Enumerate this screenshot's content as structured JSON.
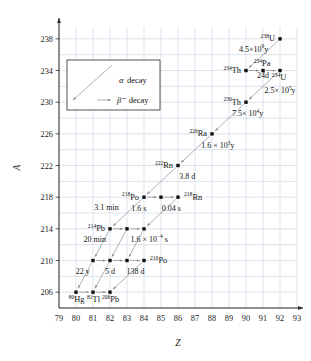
{
  "chart_data": {
    "type": "scatter",
    "title": "",
    "xlabel": "Z",
    "ylabel": "A",
    "xlim": [
      79,
      93
    ],
    "ylim": [
      204,
      239.5
    ],
    "xticks": [
      79,
      80,
      81,
      82,
      83,
      84,
      85,
      86,
      87,
      88,
      89,
      90,
      91,
      92,
      93
    ],
    "yticks": [
      206,
      210,
      214,
      218,
      222,
      226,
      230,
      234,
      238
    ],
    "grid": true,
    "legend_position": "upper-left",
    "legend": [
      {
        "symbol": "alpha",
        "label": "decay",
        "greek": "α"
      },
      {
        "symbol": "beta",
        "label": "decay",
        "greek": "β⁻"
      }
    ],
    "points": [
      {
        "Z": 92,
        "A": 238,
        "label": "U",
        "mass": "238",
        "label_pos": "left"
      },
      {
        "Z": 90,
        "A": 234,
        "label": "Th",
        "mass": "234",
        "label_pos": "left"
      },
      {
        "Z": 91,
        "A": 234,
        "label": "Pa",
        "mass": "234",
        "label_pos": "above"
      },
      {
        "Z": 92,
        "A": 234,
        "label": "U",
        "mass": "234",
        "label_pos": "below-right"
      },
      {
        "Z": 90,
        "A": 230,
        "label": "Th",
        "mass": "230",
        "label_pos": "left"
      },
      {
        "Z": 88,
        "A": 226,
        "label": "Ra",
        "mass": "226",
        "label_pos": "left"
      },
      {
        "Z": 86,
        "A": 222,
        "label": "Rn",
        "mass": "222",
        "label_pos": "left"
      },
      {
        "Z": 84,
        "A": 218,
        "label": "Po",
        "mass": "218",
        "label_pos": "left"
      },
      {
        "Z": 85,
        "A": 218,
        "label": "",
        "mass": "",
        "label_pos": "none"
      },
      {
        "Z": 86,
        "A": 218,
        "label": "Rn",
        "mass": "218",
        "label_pos": "right"
      },
      {
        "Z": 82,
        "A": 214,
        "label": "Pb",
        "mass": "214",
        "label_pos": "left"
      },
      {
        "Z": 83,
        "A": 214,
        "label": "",
        "mass": "",
        "label_pos": "none"
      },
      {
        "Z": 84,
        "A": 214,
        "label": "",
        "mass": "",
        "label_pos": "none"
      },
      {
        "Z": 81,
        "A": 210,
        "label": "",
        "mass": "",
        "label_pos": "none"
      },
      {
        "Z": 82,
        "A": 210,
        "label": "",
        "mass": "",
        "label_pos": "none"
      },
      {
        "Z": 83,
        "A": 210,
        "label": "",
        "mass": "",
        "label_pos": "none"
      },
      {
        "Z": 84,
        "A": 210,
        "label": "Po",
        "mass": "210",
        "label_pos": "right"
      },
      {
        "Z": 80,
        "A": 206,
        "label": "Hg",
        "mass": "80",
        "label_pos": "below"
      },
      {
        "Z": 81,
        "A": 206,
        "label": "Tl",
        "mass": "81",
        "label_pos": "below"
      },
      {
        "Z": 82,
        "A": 206,
        "label": "Pb",
        "mass": "206",
        "label_pos": "below"
      }
    ],
    "transitions": [
      {
        "from": [
          92,
          238
        ],
        "to": [
          90,
          234
        ],
        "type": "alpha"
      },
      {
        "from": [
          90,
          234
        ],
        "to": [
          91,
          234
        ],
        "type": "beta"
      },
      {
        "from": [
          91,
          234
        ],
        "to": [
          92,
          234
        ],
        "type": "beta"
      },
      {
        "from": [
          92,
          234
        ],
        "to": [
          90,
          230
        ],
        "type": "alpha"
      },
      {
        "from": [
          90,
          230
        ],
        "to": [
          88,
          226
        ],
        "type": "alpha"
      },
      {
        "from": [
          88,
          226
        ],
        "to": [
          86,
          222
        ],
        "type": "alpha"
      },
      {
        "from": [
          86,
          222
        ],
        "to": [
          84,
          218
        ],
        "type": "alpha"
      },
      {
        "from": [
          84,
          218
        ],
        "to": [
          85,
          218
        ],
        "type": "beta"
      },
      {
        "from": [
          85,
          218
        ],
        "to": [
          86,
          218
        ],
        "type": "beta"
      },
      {
        "from": [
          84,
          218
        ],
        "to": [
          82,
          214
        ],
        "type": "alpha"
      },
      {
        "from": [
          86,
          218
        ],
        "to": [
          84,
          214
        ],
        "type": "alpha"
      },
      {
        "from": [
          82,
          214
        ],
        "to": [
          83,
          214
        ],
        "type": "beta"
      },
      {
        "from": [
          83,
          214
        ],
        "to": [
          84,
          214
        ],
        "type": "beta"
      },
      {
        "from": [
          82,
          214
        ],
        "to": [
          81,
          210
        ],
        "type": "alpha"
      },
      {
        "from": [
          83,
          214
        ],
        "to": [
          82,
          210
        ],
        "type": "alpha"
      },
      {
        "from": [
          84,
          214
        ],
        "to": [
          83,
          210
        ],
        "type": "alpha"
      },
      {
        "from": [
          81,
          210
        ],
        "to": [
          82,
          210
        ],
        "type": "beta"
      },
      {
        "from": [
          82,
          210
        ],
        "to": [
          83,
          210
        ],
        "type": "beta"
      },
      {
        "from": [
          83,
          210
        ],
        "to": [
          84,
          210
        ],
        "type": "beta"
      },
      {
        "from": [
          81,
          210
        ],
        "to": [
          80,
          206
        ],
        "type": "alpha"
      },
      {
        "from": [
          82,
          210
        ],
        "to": [
          81,
          206
        ],
        "type": "alpha"
      },
      {
        "from": [
          84,
          210
        ],
        "to": [
          82,
          206
        ],
        "type": "alpha"
      },
      {
        "from": [
          80,
          206
        ],
        "to": [
          81,
          206
        ],
        "type": "beta"
      },
      {
        "from": [
          81,
          206
        ],
        "to": [
          82,
          206
        ],
        "type": "beta"
      }
    ],
    "annotations": [
      {
        "text": "4.5×10",
        "sup": "9",
        "tail": "y",
        "Z": 90.45,
        "A": 236.4,
        "anchor": "middle"
      },
      {
        "text": "24d",
        "sup": "",
        "tail": "",
        "Z": 91.0,
        "A": 233.05,
        "anchor": "middle"
      },
      {
        "text": "2.5× 10",
        "sup": "5",
        "tail": "y",
        "Z": 92.0,
        "A": 231.1,
        "anchor": "middle"
      },
      {
        "text": "7.5× 10",
        "sup": "4",
        "tail": "y",
        "Z": 90.1,
        "A": 228.2,
        "anchor": "middle"
      },
      {
        "text": "1.6 × 10",
        "sup": "3",
        "tail": "y",
        "Z": 88.35,
        "A": 224.2,
        "anchor": "middle"
      },
      {
        "text": "3.8 d",
        "sup": "",
        "tail": "",
        "Z": 86.55,
        "A": 220.3,
        "anchor": "middle"
      },
      {
        "text": "0.04 s",
        "sup": "",
        "tail": "",
        "Z": 85.6,
        "A": 216.3,
        "anchor": "middle"
      },
      {
        "text": "1.6 s",
        "sup": "",
        "tail": "",
        "Z": 83.7,
        "A": 216.3,
        "anchor": "middle"
      },
      {
        "text": "3.1 min",
        "sup": "",
        "tail": "",
        "Z": 81.8,
        "A": 216.4,
        "anchor": "middle"
      },
      {
        "text": "1.6 × 10",
        "sup": "−4",
        "tail": "s",
        "Z": 84.3,
        "A": 212.4,
        "anchor": "middle"
      },
      {
        "text": "20 min",
        "sup": "",
        "tail": "",
        "Z": 81.1,
        "A": 212.4,
        "anchor": "middle"
      },
      {
        "text": "138 d",
        "sup": "",
        "tail": "",
        "Z": 83.5,
        "A": 208.3,
        "anchor": "middle"
      },
      {
        "text": "5 d",
        "sup": "",
        "tail": "",
        "Z": 82.0,
        "A": 208.3,
        "anchor": "middle"
      },
      {
        "text": "22 y",
        "sup": "",
        "tail": "",
        "Z": 80.4,
        "A": 208.3,
        "anchor": "middle"
      }
    ]
  }
}
